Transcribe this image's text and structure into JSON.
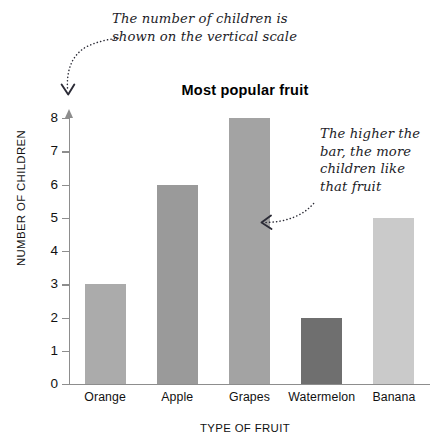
{
  "chart_data": {
    "type": "bar",
    "title": "Most popular fruit",
    "xlabel": "TYPE OF FRUIT",
    "ylabel": "NUMBER OF CHILDREN",
    "categories": [
      "Orange",
      "Apple",
      "Grapes",
      "Watermelon",
      "Banana"
    ],
    "values": [
      3,
      6,
      8,
      2,
      5
    ],
    "ylim": [
      0,
      8
    ],
    "ytick_labels": [
      "0",
      "1",
      "2",
      "3",
      "4",
      "5",
      "6",
      "7",
      "8"
    ],
    "ytick_values": [
      0,
      1,
      2,
      3,
      4,
      5,
      6,
      7,
      8
    ],
    "grid": false,
    "legend": "none",
    "bar_colors": [
      "#ababab",
      "#9a9a9a",
      "#a3a3a3",
      "#6f6f6f",
      "#cacaca"
    ]
  },
  "annotations": {
    "vertical_scale": "The number of children is\nshown on the vertical scale",
    "bar_height": "The higher the\nbar, the more\nchildren like\nthat fruit"
  },
  "colors": {
    "axis": "#8d8d8d",
    "text": "#111111",
    "annotation_text": "#1d1d28",
    "arrow": "#2b2b36",
    "background": "#ffffff"
  }
}
